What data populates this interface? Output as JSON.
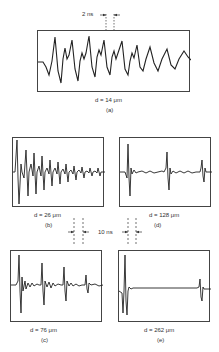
{
  "figure": {
    "panels": [
      {
        "id": "a",
        "thickness": "d = 14 μm",
        "caption": "(a)"
      },
      {
        "id": "b",
        "thickness": "d = 26 μm",
        "caption": "(b)"
      },
      {
        "id": "c",
        "thickness": "d = 76 μm",
        "caption": "(c)"
      },
      {
        "id": "d",
        "thickness": "d = 128 μm",
        "caption": "(d)"
      },
      {
        "id": "e",
        "thickness": "d = 262 μm",
        "caption": "(e)"
      }
    ],
    "scale_top": "2 ns",
    "scale_middle": "10 ns"
  }
}
